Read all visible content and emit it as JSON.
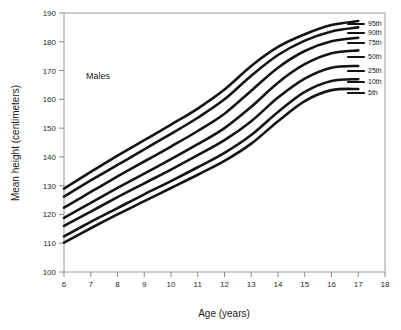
{
  "figure": {
    "annotation": "Males",
    "background_color": "#ffffff",
    "curve_color": "#141414",
    "axis_color": "#9a9a9a"
  },
  "chart_data": {
    "type": "line",
    "title": "",
    "subtitle": "",
    "annotation": "Males",
    "xlabel": "Age (years)",
    "ylabel": "Mean height (centimeters)",
    "xlim": [
      6,
      18
    ],
    "ylim": [
      100,
      190
    ],
    "xticks": [
      6,
      7,
      8,
      9,
      10,
      11,
      12,
      13,
      14,
      15,
      16,
      17,
      18
    ],
    "yticks": [
      100,
      110,
      120,
      130,
      140,
      150,
      160,
      170,
      180,
      190
    ],
    "xtick_labels": [
      "6",
      "7",
      "8",
      "9",
      "10",
      "11",
      "12",
      "13",
      "14",
      "15",
      "16",
      "17",
      "18"
    ],
    "ytick_labels": [
      "100",
      "110",
      "120",
      "130",
      "140",
      "150",
      "160",
      "170",
      "180",
      "190"
    ],
    "grid": false,
    "legend_position": "right-inline-labels",
    "x": [
      6,
      7,
      8,
      9,
      10,
      11,
      12,
      13,
      14,
      15,
      16,
      17
    ],
    "series": [
      {
        "name": "95th",
        "label": "95th",
        "values": [
          129.0,
          134.8,
          140.4,
          145.8,
          151.2,
          156.8,
          163.4,
          171.6,
          178.2,
          182.6,
          185.8,
          187.2
        ]
      },
      {
        "name": "90th",
        "label": "90th",
        "values": [
          126.2,
          131.8,
          137.2,
          142.6,
          148.0,
          153.6,
          160.0,
          168.2,
          175.4,
          180.4,
          183.6,
          185.0
        ]
      },
      {
        "name": "75th",
        "label": "75th",
        "values": [
          122.4,
          127.8,
          133.2,
          138.4,
          143.6,
          149.0,
          155.0,
          163.0,
          171.0,
          176.8,
          180.2,
          181.4
        ]
      },
      {
        "name": "50th",
        "label": "50th",
        "values": [
          118.8,
          124.0,
          129.2,
          134.2,
          139.2,
          144.4,
          150.0,
          157.4,
          165.8,
          172.2,
          176.0,
          177.0
        ]
      },
      {
        "name": "25th",
        "label": "25th",
        "values": [
          116.0,
          121.0,
          126.0,
          130.8,
          135.6,
          140.6,
          145.8,
          152.4,
          160.6,
          167.2,
          171.0,
          171.6
        ]
      },
      {
        "name": "10th",
        "label": "10th",
        "values": [
          112.4,
          117.4,
          122.2,
          127.0,
          131.6,
          136.4,
          141.4,
          147.6,
          155.6,
          162.6,
          166.4,
          167.0
        ]
      },
      {
        "name": "5th",
        "label": "5th",
        "values": [
          110.2,
          115.2,
          120.0,
          124.6,
          129.2,
          133.8,
          138.6,
          144.6,
          152.4,
          159.4,
          163.2,
          163.6
        ]
      }
    ]
  }
}
